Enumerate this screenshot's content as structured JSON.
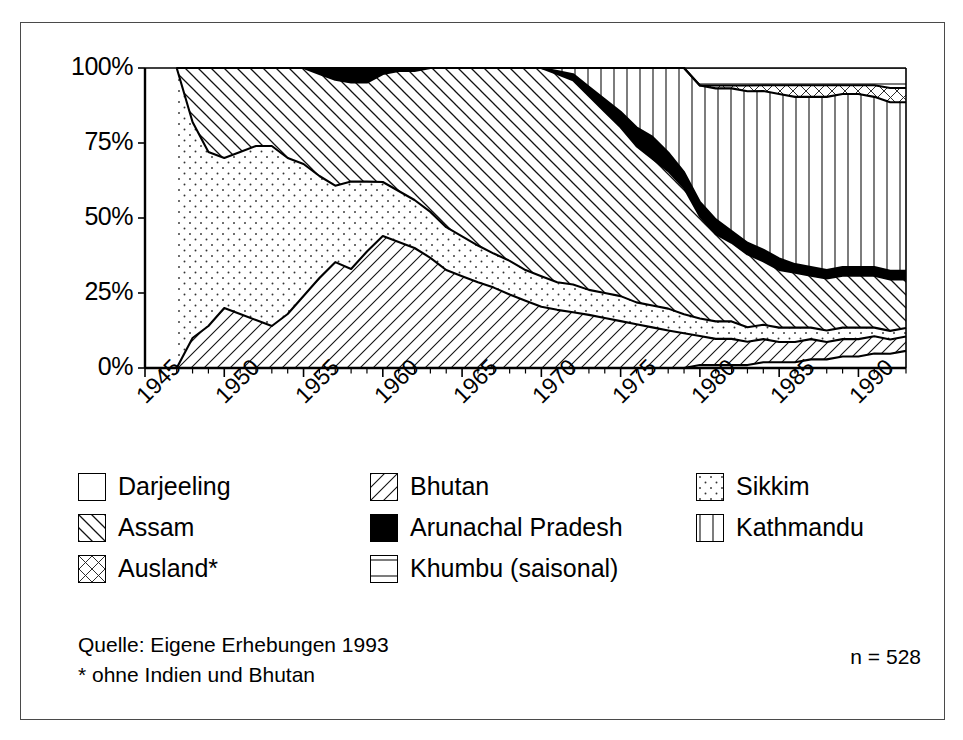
{
  "chart_data": {
    "type": "area",
    "title": "",
    "xlabel": "",
    "ylabel": "",
    "stacked": true,
    "normalized": true,
    "ylim": [
      0,
      100
    ],
    "xlim": [
      1945,
      1993
    ],
    "grid": false,
    "legend_position": "below-plot",
    "y_ticks": [
      "0%",
      "25%",
      "50%",
      "75%",
      "100%"
    ],
    "y_tick_values": [
      0,
      25,
      50,
      75,
      100
    ],
    "x_ticks": [
      "1945",
      "1950",
      "1955",
      "1960",
      "1965",
      "1970",
      "1975",
      "1980",
      "1985",
      "1990"
    ],
    "x_tick_values": [
      1945,
      1950,
      1955,
      1960,
      1965,
      1970,
      1975,
      1980,
      1985,
      1990
    ],
    "x": [
      1947,
      1948,
      1949,
      1950,
      1951,
      1952,
      1953,
      1954,
      1955,
      1956,
      1957,
      1958,
      1959,
      1960,
      1961,
      1962,
      1963,
      1964,
      1965,
      1966,
      1967,
      1968,
      1969,
      1970,
      1971,
      1972,
      1973,
      1974,
      1975,
      1976,
      1977,
      1978,
      1979,
      1980,
      1981,
      1982,
      1983,
      1984,
      1985,
      1986,
      1987,
      1988,
      1989,
      1990,
      1991,
      1992,
      1993
    ],
    "series": [
      {
        "name": "Darjeeling",
        "pattern": "blank",
        "values": [
          0,
          0,
          0,
          0,
          0,
          0,
          0,
          0,
          0,
          0,
          0,
          0,
          0,
          0,
          0,
          0,
          0,
          0,
          0,
          0,
          0,
          0,
          0,
          0,
          0,
          0,
          0,
          0,
          0,
          0,
          0,
          0,
          0,
          1,
          1,
          1,
          1,
          2,
          2,
          2,
          3,
          3,
          4,
          4,
          5,
          5,
          6
        ]
      },
      {
        "name": "Bhutan",
        "pattern": "diagonal-forward",
        "values": [
          0,
          10,
          14,
          20,
          18,
          16,
          14,
          18,
          24,
          30,
          36,
          34,
          40,
          44,
          42,
          40,
          36,
          32,
          30,
          28,
          26,
          24,
          22,
          20,
          19,
          18,
          17,
          16,
          15,
          14,
          13,
          12,
          11,
          10,
          9,
          9,
          8,
          8,
          7,
          7,
          7,
          6,
          6,
          6,
          6,
          5,
          5
        ]
      },
      {
        "name": "Sikkim",
        "pattern": "dots",
        "values": [
          100,
          72,
          58,
          50,
          54,
          58,
          60,
          52,
          44,
          34,
          26,
          30,
          24,
          18,
          17,
          16,
          15,
          14,
          13,
          12,
          11,
          11,
          10,
          10,
          9,
          9,
          8,
          8,
          8,
          7,
          7,
          7,
          6,
          6,
          6,
          6,
          5,
          5,
          5,
          5,
          4,
          4,
          4,
          4,
          3,
          3,
          3
        ]
      },
      {
        "name": "Assam",
        "pattern": "diagonal-back",
        "values": [
          0,
          18,
          28,
          30,
          28,
          26,
          26,
          30,
          32,
          34,
          36,
          34,
          34,
          36,
          40,
          43,
          47,
          52,
          55,
          58,
          60,
          63,
          66,
          68,
          68,
          66,
          62,
          58,
          54,
          50,
          47,
          44,
          40,
          35,
          30,
          27,
          25,
          22,
          20,
          19,
          18,
          18,
          18,
          18,
          18,
          18,
          17
        ]
      },
      {
        "name": "Arunachal Pradesh",
        "pattern": "solid-black",
        "values": [
          0,
          0,
          0,
          0,
          0,
          0,
          0,
          0,
          0,
          2,
          4,
          5,
          5,
          2,
          1,
          1,
          0,
          0,
          0,
          0,
          0,
          0,
          0,
          0,
          1,
          2,
          3,
          4,
          5,
          6,
          7,
          6,
          5,
          5,
          5,
          4,
          4,
          4,
          4,
          3,
          3,
          3,
          3,
          3,
          3,
          3,
          3
        ]
      },
      {
        "name": "Kathmandu",
        "pattern": "vertical",
        "values": [
          0,
          0,
          0,
          0,
          0,
          0,
          0,
          0,
          0,
          0,
          0,
          0,
          0,
          0,
          0,
          0,
          0,
          0,
          0,
          0,
          0,
          0,
          0,
          0,
          1,
          2,
          6,
          10,
          14,
          19,
          22,
          27,
          33,
          40,
          45,
          49,
          52,
          55,
          57,
          58,
          59,
          60,
          60,
          60,
          59,
          59,
          59
        ]
      },
      {
        "name": "Ausland*",
        "pattern": "cross-hatch",
        "values": [
          0,
          0,
          0,
          0,
          0,
          0,
          0,
          0,
          0,
          0,
          0,
          0,
          0,
          0,
          0,
          0,
          0,
          0,
          0,
          0,
          0,
          0,
          0,
          0,
          0,
          0,
          0,
          0,
          0,
          0,
          0,
          0,
          0,
          0,
          1,
          1,
          2,
          2,
          3,
          4,
          4,
          4,
          3,
          3,
          4,
          5,
          5
        ]
      },
      {
        "name": "Khumbu (saisonal)",
        "pattern": "horizontal",
        "values": [
          0,
          0,
          0,
          0,
          0,
          0,
          0,
          0,
          0,
          0,
          0,
          0,
          0,
          0,
          0,
          0,
          0,
          0,
          0,
          0,
          0,
          0,
          0,
          0,
          0,
          0,
          0,
          0,
          0,
          0,
          0,
          0,
          0,
          6,
          6,
          6,
          6,
          6,
          6,
          6,
          6,
          6,
          6,
          6,
          6,
          7,
          7
        ]
      }
    ]
  },
  "legend": {
    "rows": [
      [
        {
          "label": "Darjeeling",
          "pattern": "blank"
        },
        {
          "label": "Bhutan",
          "pattern": "diagonal-forward"
        },
        {
          "label": "Sikkim",
          "pattern": "dots"
        }
      ],
      [
        {
          "label": "Assam",
          "pattern": "diagonal-back"
        },
        {
          "label": "Arunachal Pradesh",
          "pattern": "solid-black"
        },
        {
          "label": "Kathmandu",
          "pattern": "vertical"
        }
      ],
      [
        {
          "label": "Ausland*",
          "pattern": "cross-hatch"
        },
        {
          "label": "Khumbu (saisonal)",
          "pattern": "horizontal"
        }
      ]
    ]
  },
  "footer": {
    "source_line": "Quelle: Eigene Erhebungen 1993",
    "note_line": "* ohne Indien und Bhutan",
    "n_label": "n = 528"
  }
}
